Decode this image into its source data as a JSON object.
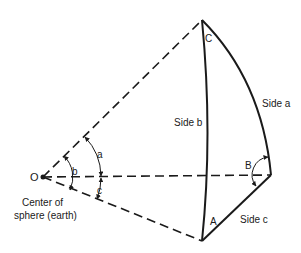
{
  "diagram": {
    "vertices": {
      "center": "O",
      "top": "C",
      "right": "B",
      "bottom": "A"
    },
    "center_caption_line1": "Center of",
    "center_caption_line2": "sphere (earth)",
    "sides": {
      "a": "Side a",
      "b": "Side b",
      "c": "Side c"
    },
    "angles_at_center": {
      "a": "a",
      "b": "b",
      "c": "c"
    },
    "colors": {
      "line": "#1a1a1a",
      "background": "#ffffff"
    }
  }
}
